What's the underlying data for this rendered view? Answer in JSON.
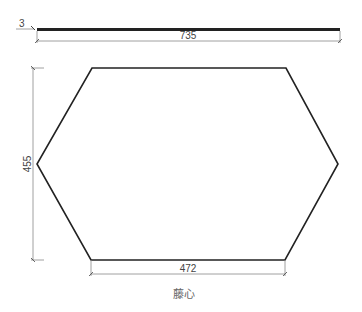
{
  "drawing": {
    "side_view": {
      "thickness_label": "3",
      "length_label": "735"
    },
    "top_view": {
      "height_label": "455",
      "bottom_width_label": "472",
      "shape": "hexagon"
    },
    "caption": "藤心",
    "colors": {
      "outline": "#222222",
      "dimension": "#888888",
      "text": "#444444"
    }
  }
}
